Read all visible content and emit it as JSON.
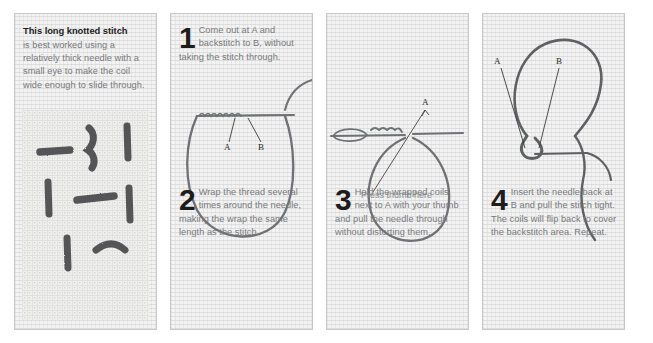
{
  "document": {
    "title": "Long knotted stitch instructions",
    "panel_count": 4
  },
  "colors": {
    "panel_bg": "#f3f3f3",
    "panel_border": "#c9c9c9",
    "heading_text": "#1d1d1d",
    "body_text": "#77797c",
    "label_text": "#2a2a2a",
    "thread": "#6f7175",
    "page_bg": "#ffffff"
  },
  "panels": [
    {
      "id": "panel-intro",
      "heading": "This long knotted stitch",
      "body": "is best worked using a relatively thick needle with a small eye to make the coil wide enough to slide through.",
      "figure": {
        "type": "photograph",
        "description": "Sample of long knotted stitches worked on aida fabric"
      }
    },
    {
      "id": "panel-step-1-2",
      "step_top": {
        "number": "1",
        "body": "Come out at A and backstitch to B, without taking the stitch through."
      },
      "step_bottom": {
        "number": "2",
        "body": "Wrap the thread several times around the needle, making the wrap the same length as the stitch."
      },
      "figure": {
        "type": "diagram",
        "description": "Needle held with a loop of thread; points A and B marked on the backstitch",
        "labels": [
          "A",
          "B"
        ]
      }
    },
    {
      "id": "panel-step-3",
      "step_bottom": {
        "number": "3",
        "body": "Hold the wrapped coils next to A with your thumb and pull the needle through without distorting them."
      },
      "figure": {
        "type": "diagram",
        "description": "Wrapped coils beside point A with a large thread loop below",
        "labels": [
          "A",
          "Press thumb here"
        ]
      }
    },
    {
      "id": "panel-step-4",
      "step_bottom": {
        "number": "4",
        "body": "Insert the needle back at B and pull the stitch tight. The coils will flip back to cover the backstitch area. Repeat."
      },
      "figure": {
        "type": "diagram",
        "description": "Thread loop with coils flipping back over the backstitch between A and B",
        "labels": [
          "A",
          "B"
        ]
      }
    }
  ]
}
